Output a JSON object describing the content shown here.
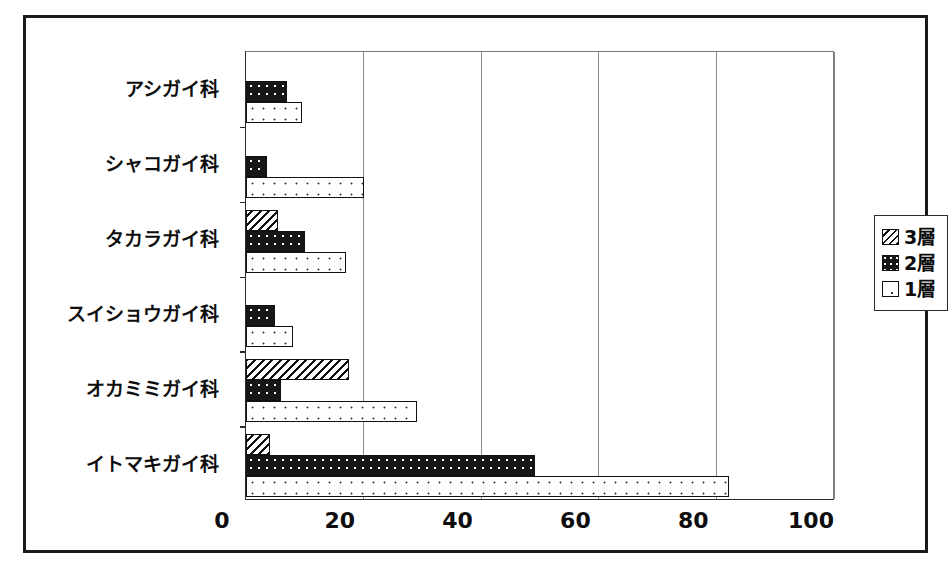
{
  "chart_data": {
    "type": "bar",
    "orientation": "horizontal",
    "title": "",
    "subtitle": "",
    "xlabel": "",
    "ylabel": "",
    "xlim": [
      0,
      100
    ],
    "ylim": null,
    "grid": "vertical",
    "legend_position": "right",
    "xticks": [
      "0",
      "20",
      "40",
      "60",
      "80",
      "100"
    ],
    "xtick_values": [
      0,
      20,
      40,
      60,
      80,
      100
    ],
    "categories": [
      "アシガイ科",
      "シャコガイ科",
      "タカラガイ科",
      "スイショウガイ科",
      "オカミミガイ科",
      "イトマキガイ科"
    ],
    "series": [
      {
        "name": "3層",
        "pattern": "diagonal-hatch",
        "values": [
          0,
          0,
          5.5,
          0,
          17.5,
          4
        ]
      },
      {
        "name": "2層",
        "pattern": "dark-dotted",
        "values": [
          7,
          3.5,
          10,
          5,
          6,
          49
        ]
      },
      {
        "name": "1層",
        "pattern": "light-dotted",
        "values": [
          9.5,
          20,
          17,
          8,
          29,
          82
        ]
      }
    ]
  },
  "legend": {
    "items": [
      {
        "label": "3層",
        "swatch": "lvl3"
      },
      {
        "label": "2層",
        "swatch": "lvl2"
      },
      {
        "label": "1層",
        "swatch": "lvl1"
      }
    ]
  },
  "colors": {
    "frame": "#1a1a1a",
    "axis": "#2b2b2b",
    "gridline": "#8a8a8a",
    "bar_outline": "#111111",
    "fill_dark": "#171717",
    "fill_light": "#ffffff",
    "text": "#0d0d0d",
    "background": "#ffffff"
  }
}
